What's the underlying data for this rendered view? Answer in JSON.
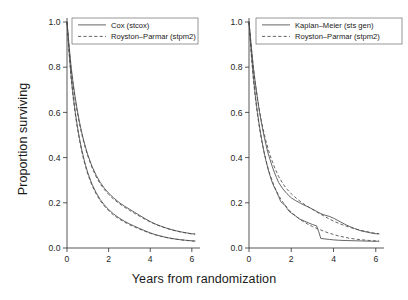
{
  "figure": {
    "xlabel": "Years from randomization",
    "ylabel": "Proportion surviving",
    "background": "#ffffff",
    "ink": "#4a4a4a"
  },
  "chart_data": [
    {
      "type": "line",
      "panel": "left",
      "title": "",
      "xlabel": "Years from randomization",
      "ylabel": "Proportion surviving",
      "xlim": [
        0,
        6.2
      ],
      "ylim": [
        0.0,
        1.0
      ],
      "xticks": [
        0,
        2,
        4,
        6
      ],
      "xticklabels": [
        "0",
        "2",
        "4",
        "6"
      ],
      "yticks": [
        0.0,
        0.2,
        0.4,
        0.6,
        0.8,
        1.0
      ],
      "yticklabels": [
        "0.0",
        "0.2",
        "0.4",
        "0.6",
        "0.8",
        "1.0"
      ],
      "grid": false,
      "legend_position": "top-right",
      "legend": [
        "Cox (stcox)",
        "Royston–Parmar (stpm2)"
      ],
      "series": [
        {
          "name": "Cox (stcox)",
          "style": "solid",
          "group": "upper",
          "x": [
            0,
            0.1,
            0.2,
            0.3,
            0.4,
            0.5,
            0.6,
            0.7,
            0.8,
            0.9,
            1.0,
            1.2,
            1.4,
            1.6,
            1.8,
            2.0,
            2.25,
            2.5,
            2.75,
            3.0,
            3.25,
            3.5,
            3.75,
            4.0,
            4.25,
            4.5,
            4.75,
            5.0,
            5.25,
            5.5,
            5.75,
            6.0,
            6.15
          ],
          "y": [
            1.0,
            0.895,
            0.8,
            0.726,
            0.663,
            0.607,
            0.558,
            0.515,
            0.477,
            0.443,
            0.412,
            0.362,
            0.322,
            0.29,
            0.264,
            0.243,
            0.221,
            0.202,
            0.186,
            0.172,
            0.158,
            0.144,
            0.13,
            0.117,
            0.106,
            0.097,
            0.089,
            0.082,
            0.076,
            0.071,
            0.067,
            0.063,
            0.062
          ]
        },
        {
          "name": "Royston–Parmar (stpm2)",
          "style": "dashed",
          "group": "upper",
          "x": [
            0,
            0.1,
            0.2,
            0.3,
            0.4,
            0.5,
            0.6,
            0.7,
            0.8,
            0.9,
            1.0,
            1.2,
            1.4,
            1.6,
            1.8,
            2.0,
            2.25,
            2.5,
            2.75,
            3.0,
            3.25,
            3.5,
            3.75,
            4.0,
            4.25,
            4.5,
            4.75,
            5.0,
            5.25,
            5.5,
            5.75,
            6.0,
            6.15
          ],
          "y": [
            1.0,
            0.885,
            0.79,
            0.715,
            0.652,
            0.597,
            0.549,
            0.507,
            0.47,
            0.437,
            0.407,
            0.356,
            0.315,
            0.283,
            0.258,
            0.237,
            0.215,
            0.197,
            0.181,
            0.167,
            0.153,
            0.14,
            0.127,
            0.115,
            0.105,
            0.096,
            0.088,
            0.081,
            0.075,
            0.07,
            0.066,
            0.062,
            0.061
          ]
        },
        {
          "name": "Cox (stcox)",
          "style": "solid",
          "group": "lower",
          "x": [
            0,
            0.1,
            0.2,
            0.3,
            0.4,
            0.5,
            0.6,
            0.7,
            0.8,
            0.9,
            1.0,
            1.2,
            1.4,
            1.6,
            1.8,
            2.0,
            2.25,
            2.5,
            2.75,
            3.0,
            3.25,
            3.5,
            3.75,
            4.0,
            4.25,
            4.5,
            4.75,
            5.0,
            5.25,
            5.5,
            5.75,
            6.0,
            6.15
          ],
          "y": [
            1.0,
            0.87,
            0.757,
            0.672,
            0.6,
            0.538,
            0.485,
            0.439,
            0.399,
            0.364,
            0.333,
            0.283,
            0.245,
            0.214,
            0.19,
            0.17,
            0.15,
            0.133,
            0.119,
            0.107,
            0.096,
            0.086,
            0.076,
            0.067,
            0.059,
            0.053,
            0.047,
            0.043,
            0.039,
            0.036,
            0.034,
            0.032,
            0.031
          ]
        },
        {
          "name": "Royston–Parmar (stpm2)",
          "style": "dashed",
          "group": "lower",
          "x": [
            0,
            0.1,
            0.2,
            0.3,
            0.4,
            0.5,
            0.6,
            0.7,
            0.8,
            0.9,
            1.0,
            1.2,
            1.4,
            1.6,
            1.8,
            2.0,
            2.25,
            2.5,
            2.75,
            3.0,
            3.25,
            3.5,
            3.75,
            4.0,
            4.25,
            4.5,
            4.75,
            5.0,
            5.25,
            5.5,
            5.75,
            6.0,
            6.15
          ],
          "y": [
            1.0,
            0.862,
            0.748,
            0.662,
            0.59,
            0.529,
            0.477,
            0.431,
            0.391,
            0.357,
            0.326,
            0.277,
            0.239,
            0.209,
            0.185,
            0.165,
            0.145,
            0.129,
            0.115,
            0.103,
            0.093,
            0.083,
            0.074,
            0.065,
            0.058,
            0.052,
            0.047,
            0.042,
            0.039,
            0.036,
            0.033,
            0.031,
            0.03
          ]
        }
      ]
    },
    {
      "type": "line",
      "panel": "right",
      "title": "",
      "xlabel": "Years from randomization",
      "ylabel": "Proportion surviving",
      "xlim": [
        0,
        6.2
      ],
      "ylim": [
        0.0,
        1.0
      ],
      "xticks": [
        0,
        2,
        4,
        6
      ],
      "xticklabels": [
        "0",
        "2",
        "4",
        "6"
      ],
      "yticks": [
        0.0,
        0.2,
        0.4,
        0.6,
        0.8,
        1.0
      ],
      "yticklabels": [
        "0.0",
        "0.2",
        "0.4",
        "0.6",
        "0.8",
        "1.0"
      ],
      "grid": false,
      "legend_position": "top-right",
      "legend": [
        "Kaplan–Meier (sts gen)",
        "Royston–Parmar (stpm2)"
      ],
      "series": [
        {
          "name": "Kaplan–Meier (sts gen)",
          "style": "solid",
          "group": "upper",
          "x": [
            0,
            0.1,
            0.2,
            0.3,
            0.4,
            0.5,
            0.6,
            0.7,
            0.8,
            0.9,
            1.0,
            1.1,
            1.2,
            1.3,
            1.4,
            1.6,
            1.8,
            2.0,
            2.2,
            2.4,
            2.6,
            2.8,
            3.0,
            3.2,
            3.4,
            3.6,
            3.8,
            4.0,
            4.2,
            4.4,
            4.6,
            4.8,
            5.0,
            5.3,
            5.6,
            5.9,
            6.15
          ],
          "y": [
            1.0,
            0.9,
            0.805,
            0.73,
            0.663,
            0.6,
            0.548,
            0.5,
            0.458,
            0.42,
            0.39,
            0.36,
            0.335,
            0.312,
            0.29,
            0.262,
            0.24,
            0.222,
            0.21,
            0.2,
            0.19,
            0.182,
            0.172,
            0.162,
            0.152,
            0.145,
            0.14,
            0.132,
            0.122,
            0.112,
            0.102,
            0.094,
            0.086,
            0.076,
            0.07,
            0.064,
            0.062
          ]
        },
        {
          "name": "Royston–Parmar (stpm2)",
          "style": "dashed",
          "group": "upper",
          "x": [
            0,
            0.1,
            0.2,
            0.3,
            0.4,
            0.5,
            0.6,
            0.7,
            0.8,
            0.9,
            1.0,
            1.2,
            1.4,
            1.6,
            1.8,
            2.0,
            2.25,
            2.5,
            2.75,
            3.0,
            3.25,
            3.5,
            3.75,
            4.0,
            4.25,
            4.5,
            4.75,
            5.0,
            5.25,
            5.5,
            5.75,
            6.0,
            6.15
          ],
          "y": [
            1.0,
            0.893,
            0.8,
            0.726,
            0.662,
            0.605,
            0.556,
            0.513,
            0.475,
            0.44,
            0.41,
            0.358,
            0.317,
            0.285,
            0.26,
            0.24,
            0.219,
            0.201,
            0.185,
            0.171,
            0.157,
            0.144,
            0.131,
            0.119,
            0.109,
            0.1,
            0.092,
            0.085,
            0.079,
            0.074,
            0.069,
            0.065,
            0.064
          ]
        },
        {
          "name": "Kaplan–Meier (sts gen)",
          "style": "solid",
          "group": "lower",
          "x": [
            0,
            0.1,
            0.2,
            0.3,
            0.4,
            0.5,
            0.6,
            0.7,
            0.8,
            0.9,
            1.0,
            1.1,
            1.2,
            1.3,
            1.4,
            1.5,
            1.6,
            1.7,
            1.8,
            1.9,
            2.0,
            2.2,
            2.4,
            2.6,
            2.8,
            3.0,
            3.2,
            3.3,
            3.4,
            3.6,
            3.8,
            4.0,
            4.3,
            4.6,
            5.0,
            5.4,
            5.8,
            6.15
          ],
          "y": [
            1.0,
            0.875,
            0.765,
            0.675,
            0.6,
            0.535,
            0.48,
            0.43,
            0.388,
            0.35,
            0.318,
            0.29,
            0.268,
            0.25,
            0.228,
            0.206,
            0.196,
            0.19,
            0.175,
            0.162,
            0.155,
            0.142,
            0.128,
            0.12,
            0.112,
            0.104,
            0.098,
            0.072,
            0.042,
            0.04,
            0.038,
            0.036,
            0.034,
            0.033,
            0.032,
            0.031,
            0.03,
            0.03
          ]
        },
        {
          "name": "Royston–Parmar (stpm2)",
          "style": "dashed",
          "group": "lower",
          "x": [
            0,
            0.1,
            0.2,
            0.3,
            0.4,
            0.5,
            0.6,
            0.7,
            0.8,
            0.9,
            1.0,
            1.2,
            1.4,
            1.6,
            1.8,
            2.0,
            2.25,
            2.5,
            2.75,
            3.0,
            3.25,
            3.5,
            3.75,
            4.0,
            4.25,
            4.5,
            4.75,
            5.0,
            5.25,
            5.5,
            5.75,
            6.0,
            6.15
          ],
          "y": [
            1.0,
            0.865,
            0.75,
            0.663,
            0.59,
            0.528,
            0.475,
            0.428,
            0.388,
            0.353,
            0.322,
            0.272,
            0.233,
            0.203,
            0.178,
            0.158,
            0.138,
            0.121,
            0.107,
            0.095,
            0.085,
            0.076,
            0.067,
            0.06,
            0.053,
            0.048,
            0.043,
            0.04,
            0.037,
            0.035,
            0.033,
            0.031,
            0.031
          ]
        }
      ]
    }
  ]
}
